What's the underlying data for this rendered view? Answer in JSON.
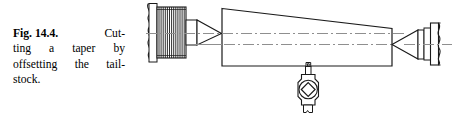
{
  "figure": {
    "label": "Fig. 14.4.",
    "caption_lines": [
      "Cut-",
      "ting a taper by",
      "offsetting the tail-",
      "stock."
    ],
    "caption_full": "Fig. 14.4. Cutting a taper by offsetting the tailstock."
  },
  "diagram": {
    "type": "engineering-line-drawing",
    "line_color": "#1a1a1a",
    "centerline_color": "#8c8c8c",
    "fill_color": "#ffffff",
    "stroke_width": 1,
    "parts": [
      {
        "name": "headstock-spindle-break",
        "kind": "break-line"
      },
      {
        "name": "spindle-flange",
        "kind": "rectangle"
      },
      {
        "name": "threaded-spindle-nose",
        "kind": "thread-hatching",
        "thread_count": 14
      },
      {
        "name": "spindle-shoulder",
        "kind": "rectangle"
      },
      {
        "name": "live-center",
        "kind": "cone-point"
      },
      {
        "name": "workpiece-taper",
        "kind": "trapezoid"
      },
      {
        "name": "lathe-axis-centerline",
        "kind": "dash-dot-line"
      },
      {
        "name": "workpiece-axis-centerline",
        "kind": "dash-dot-line"
      },
      {
        "name": "dead-center-point",
        "kind": "cone-point"
      },
      {
        "name": "tailstock-center-collars",
        "kind": "stacked-rings"
      },
      {
        "name": "tailstock-quill-break",
        "kind": "break-line"
      },
      {
        "name": "tool-holder",
        "kind": "body"
      },
      {
        "name": "tool-bit-tip",
        "kind": "small-rectangle"
      },
      {
        "name": "tool-clamp-diamond",
        "kind": "diamond-in-circle"
      },
      {
        "name": "tool-shank-foot",
        "kind": "tab"
      }
    ]
  }
}
